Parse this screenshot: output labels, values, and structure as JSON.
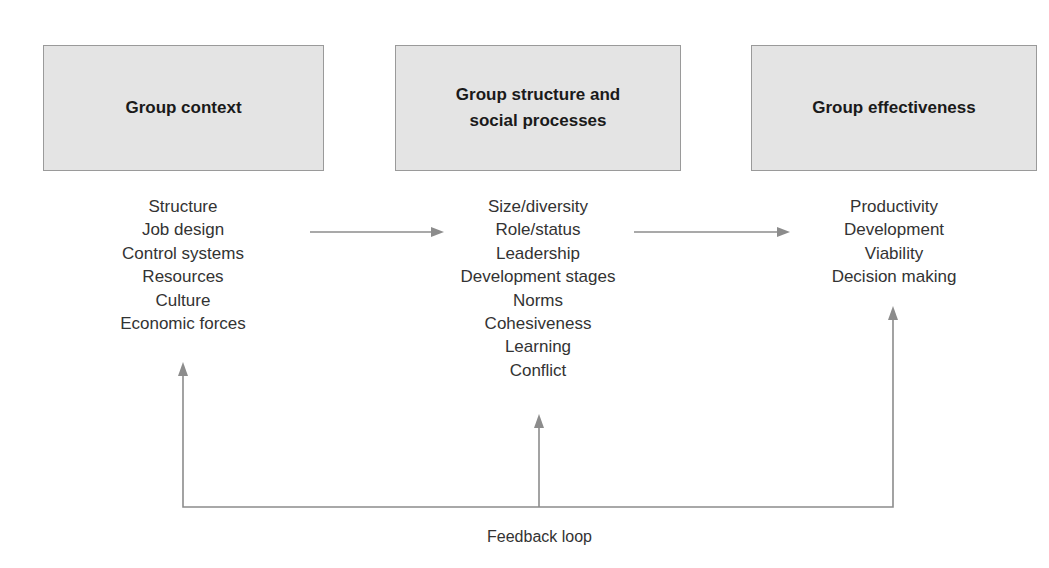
{
  "diagram": {
    "columns": [
      {
        "title": "Group context",
        "items": [
          "Structure",
          "Job design",
          "Control systems",
          "Resources",
          "Culture",
          "Economic forces"
        ]
      },
      {
        "title": "Group structure and\nsocial processes",
        "items": [
          "Size/diversity",
          "Role/status",
          "Leadership",
          "Development stages",
          "Norms",
          "Cohesiveness",
          "Learning",
          "Conflict"
        ]
      },
      {
        "title": "Group effectiveness",
        "items": [
          "Productivity",
          "Development",
          "Viability",
          "Decision making"
        ]
      }
    ],
    "feedback_label": "Feedback loop",
    "colors": {
      "box_fill": "#e4e4e4",
      "box_border": "#9a9a9a",
      "arrow": "#8c8c8c",
      "text": "#333333"
    }
  }
}
